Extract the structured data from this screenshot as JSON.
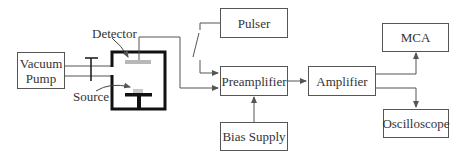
{
  "diagram": {
    "title": "",
    "type": "block-diagram",
    "colors": {
      "line": "#555555",
      "chamber": "#111111",
      "detector_fill": "#b8b8b8",
      "text": "#333333"
    },
    "nodes": {
      "vacuum_pump": {
        "label_line1": "Vacuum",
        "label_line2": "Pump"
      },
      "chamber": {
        "detector_label": "Detector",
        "source_label": "Source"
      },
      "pulser": {
        "label": "Pulser"
      },
      "preamplifier": {
        "label": "Preamplifier"
      },
      "bias_supply": {
        "label": "Bias Supply"
      },
      "amplifier": {
        "label": "Amplifier"
      },
      "mca": {
        "label": "MCA"
      },
      "oscilloscope": {
        "label": "Oscilloscope"
      }
    },
    "edges": [
      {
        "from": "Vacuum Pump",
        "to": "Chamber",
        "kind": "pipe with valve"
      },
      {
        "from": "Detector",
        "to": "Preamplifier"
      },
      {
        "from": "Pulser",
        "to": "Preamplifier",
        "kind": "via switch"
      },
      {
        "from": "Bias Supply",
        "to": "Preamplifier"
      },
      {
        "from": "Preamplifier",
        "to": "Amplifier"
      },
      {
        "from": "Amplifier",
        "to": "MCA"
      },
      {
        "from": "Amplifier",
        "to": "Oscilloscope"
      }
    ]
  }
}
